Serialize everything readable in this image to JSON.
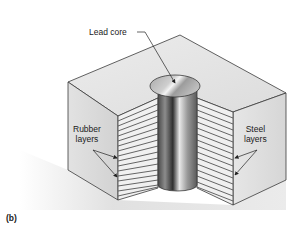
{
  "figure": {
    "panel_label": "(b)",
    "labels": {
      "lead_core": "Lead core",
      "rubber_layers_line1": "Rubber",
      "rubber_layers_line2": "layers",
      "steel_layers_line1": "Steel",
      "steel_layers_line2": "layers"
    },
    "colors": {
      "outline": "#3a3a3a",
      "top_face": "#e4e4e4",
      "side_face": "#d8d8d8",
      "layer_light": "#f2f2f2",
      "layer_dark": "#6a6a6a",
      "lead_core_mid": "#9a9a9a",
      "shadow": "#c8c8c8"
    }
  }
}
